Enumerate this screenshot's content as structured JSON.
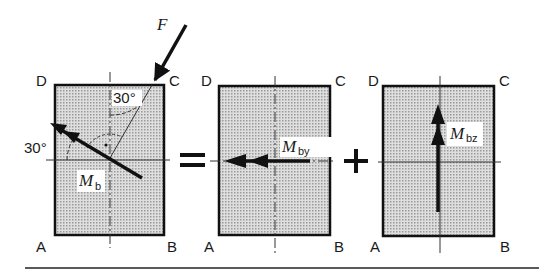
{
  "diagram": {
    "operators": {
      "equals": "=",
      "plus": "+"
    },
    "colors": {
      "fill": "#c8c8c8",
      "stroke": "#111111",
      "axis": "#333333"
    },
    "panels": [
      {
        "id": "panel-1",
        "corners": {
          "top_left": "D",
          "top_right": "C",
          "bottom_left": "A",
          "bottom_right": "B"
        },
        "force_label": "F",
        "angle_top": "30°",
        "angle_left": "30°",
        "moment_label": "M",
        "moment_sub": "b"
      },
      {
        "id": "panel-2",
        "corners": {
          "top_left": "D",
          "top_right": "C",
          "bottom_left": "A",
          "bottom_right": "B"
        },
        "moment_label": "M",
        "moment_sub": "by"
      },
      {
        "id": "panel-3",
        "corners": {
          "top_left": "D",
          "top_right": "C",
          "bottom_left": "A",
          "bottom_right": "B"
        },
        "moment_label": "M",
        "moment_sub": "bz"
      }
    ]
  }
}
